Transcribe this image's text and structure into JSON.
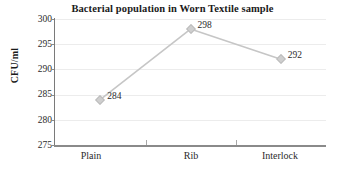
{
  "chart_data": {
    "type": "line",
    "title": "Bacterial population in Worn Textile sample",
    "xlabel": "",
    "ylabel": "CFU/ml",
    "categories": [
      "Plain",
      "Rib",
      "Interlock"
    ],
    "values": [
      284,
      298,
      292
    ],
    "data_labels": [
      "284",
      "298",
      "292"
    ],
    "ylim": [
      275,
      300
    ],
    "yticks": [
      300,
      295,
      290,
      285,
      280,
      275
    ],
    "ytick_labels": [
      "300",
      "295",
      "290",
      "285",
      "280",
      "275"
    ],
    "grid": true,
    "legend": false,
    "series": [
      {
        "name": "Bacterial population",
        "values": [
          284,
          298,
          292
        ]
      }
    ],
    "colors": {
      "line": "#c6c6c6",
      "marker": "#cfcfcf",
      "gridline": "#ececec",
      "axis": "#8a8a8a",
      "text": "#1a1a1a",
      "background": "#ffffff"
    }
  }
}
